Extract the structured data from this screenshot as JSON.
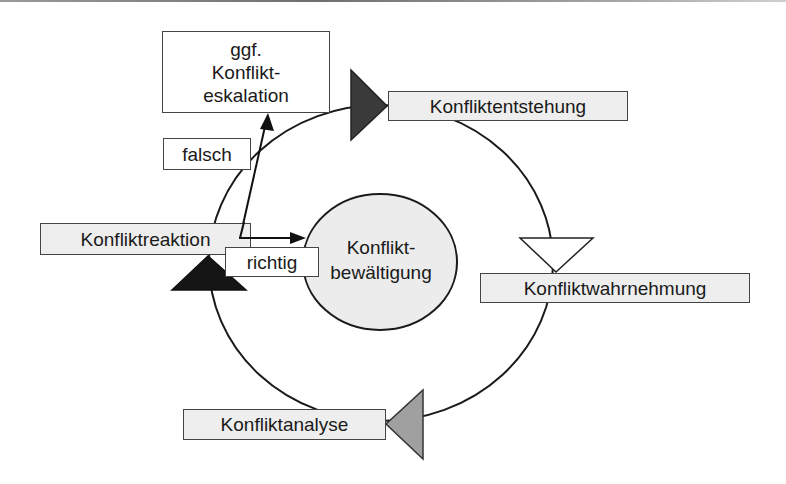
{
  "diagram": {
    "title": "",
    "type": "cycle",
    "stages": [
      {
        "id": "entstehung",
        "label": "Konfliktentstehung",
        "marker_color": "#3a3a3a"
      },
      {
        "id": "wahrnehmung",
        "label": "Konfliktwahrnehmung",
        "marker_color": "#ffffff"
      },
      {
        "id": "analyse",
        "label": "Konfliktanalyse",
        "marker_color": "#a0a0a0"
      },
      {
        "id": "reaktion",
        "label": "Konfliktreaktion",
        "marker_color": "#151515"
      }
    ],
    "center": {
      "line1": "Konflikt-",
      "line2": "bewältigung",
      "fill": "#ececec"
    },
    "escalation": {
      "line1": "ggf.",
      "line2": "Konflikt-",
      "line3": "eskalation"
    },
    "branches": {
      "wrong": "falsch",
      "right": "richtig"
    },
    "colors": {
      "box_fill": "#eeeeee",
      "stroke": "#1a1a1a",
      "circle_fill": "#ececec"
    }
  }
}
